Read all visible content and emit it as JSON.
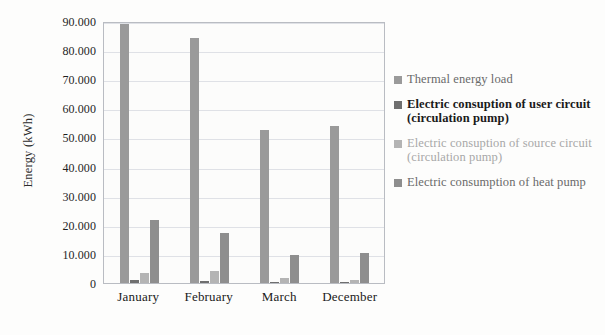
{
  "chart_data": {
    "type": "bar",
    "title": "",
    "subtitle": "",
    "xlabel": "",
    "ylabel": "Energy (kWh)",
    "categories": [
      "January",
      "February",
      "March",
      "December"
    ],
    "ylim": [
      0,
      90000
    ],
    "ytick_values": [
      0,
      10000,
      20000,
      30000,
      40000,
      50000,
      60000,
      70000,
      80000,
      90000
    ],
    "ytick_labels": [
      "0",
      "10.000",
      "20.000",
      "30.000",
      "40.000",
      "50.000",
      "60.000",
      "70.000",
      "80.000",
      "90.000"
    ],
    "grid": true,
    "legend_position": "right",
    "series": [
      {
        "name": "Thermal energy load",
        "color": "#9a9a9a",
        "values": [
          89000,
          84300,
          52500,
          53800
        ]
      },
      {
        "name": "Electric consuption of user circuit (circulation pump)",
        "color": "#6f6f6f",
        "values": [
          1200,
          800,
          400,
          500
        ]
      },
      {
        "name": "Electric consuption of source circuit (circulation pump)",
        "color": "#b4b4b4",
        "values": [
          3600,
          4200,
          1800,
          1200
        ]
      },
      {
        "name": "Electric consumption of heat pump",
        "color": "#8e8e8e",
        "values": [
          21800,
          17200,
          9700,
          10300
        ]
      }
    ]
  },
  "colors": {
    "plot_background": "#fcfcfb",
    "plot_border": "#b9bcc2",
    "gridline": "#dfe1e6",
    "text": "#1a1a1a"
  }
}
